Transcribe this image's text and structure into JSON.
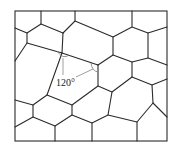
{
  "diagram": {
    "colors": {
      "background": "#ffffff",
      "boundary": "#2a2a2a",
      "annotation": "#777777"
    },
    "frame": {
      "x": 15,
      "y": 11,
      "width": 152,
      "height": 130
    },
    "annotation": {
      "label": "120°",
      "label_x": 56,
      "label_y": 86
    },
    "vertices_note": "grain boundary network, hexagonal-like cells"
  }
}
